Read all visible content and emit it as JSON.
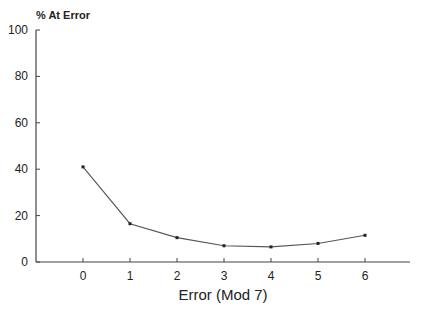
{
  "chart_data": {
    "type": "line",
    "title": "",
    "ylabel": "% At Error",
    "xlabel": "Error (Mod 7)",
    "x": [
      0,
      1,
      2,
      3,
      4,
      5,
      6
    ],
    "categories": [
      "0",
      "1",
      "2",
      "3",
      "4",
      "5",
      "6"
    ],
    "series": [
      {
        "name": "% At Error",
        "values": [
          41,
          16.5,
          10.5,
          7,
          6.5,
          8,
          11.5
        ]
      }
    ],
    "ylim": [
      0,
      100
    ],
    "yticks": [
      0,
      20,
      40,
      60,
      80,
      100
    ],
    "xticks": [
      0,
      1,
      2,
      3,
      4,
      5,
      6
    ],
    "grid": false,
    "legend": "none"
  }
}
